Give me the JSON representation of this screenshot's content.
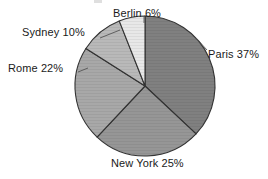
{
  "chart_data": {
    "type": "pie",
    "title": "",
    "xlabel": "",
    "ylabel": "",
    "legend_position": "none",
    "labels_position": "outside",
    "grid": false,
    "start_angle_deg": 0,
    "direction": "clockwise",
    "categories": [
      "Paris",
      "New York",
      "Rome",
      "Sydney",
      "Berlin"
    ],
    "values": [
      37,
      25,
      22,
      10,
      6
    ],
    "unit": "%",
    "total": 100,
    "slices": [
      {
        "name": "Paris",
        "value": 37,
        "label": "Paris 37%",
        "color": "#808080",
        "start_deg": 0.0,
        "end_deg": 133.2
      },
      {
        "name": "New York",
        "value": 25,
        "label": "New York 25%",
        "color": "#969696",
        "start_deg": 133.2,
        "end_deg": 223.2
      },
      {
        "name": "Rome",
        "value": 22,
        "label": "Rome 22%",
        "color": "#a8a8a8",
        "start_deg": 223.2,
        "end_deg": 302.4
      },
      {
        "name": "Sydney",
        "value": 10,
        "label": "Sydney 10%",
        "color": "#b9b9b9",
        "start_deg": 302.4,
        "end_deg": 338.4
      },
      {
        "name": "Berlin",
        "value": 6,
        "label": "Berlin 6%",
        "color": "#e8e8e8",
        "start_deg": 338.4,
        "end_deg": 360.0
      }
    ]
  },
  "labels": {
    "paris": "Paris 37%",
    "new_york": "New York 25%",
    "rome": "Rome 22%",
    "sydney": "Sydney 10%",
    "berlin": "Berlin 6%"
  },
  "colors": {
    "background": "#ffffff",
    "outline": "#333333",
    "text": "#1a1a1a"
  }
}
